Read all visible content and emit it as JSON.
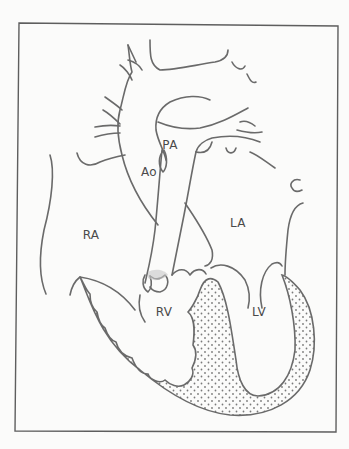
{
  "diagram": {
    "type": "anatomical-line-drawing",
    "colors": {
      "line": "#6a6a6a",
      "frame": "#5e5e5e",
      "stipple": "#7a7a7a",
      "background": "#fbfbfa"
    },
    "labels": [
      {
        "id": "PA",
        "text": "PA",
        "x": 170,
        "y": 145
      },
      {
        "id": "Ao",
        "text": "Ao",
        "x": 149,
        "y": 172
      },
      {
        "id": "RA",
        "text": "RA",
        "x": 91,
        "y": 235
      },
      {
        "id": "LA",
        "text": "LA",
        "x": 238,
        "y": 223
      },
      {
        "id": "RV",
        "text": "RV",
        "x": 164,
        "y": 312
      },
      {
        "id": "LV",
        "text": "LV",
        "x": 259,
        "y": 312
      }
    ]
  }
}
